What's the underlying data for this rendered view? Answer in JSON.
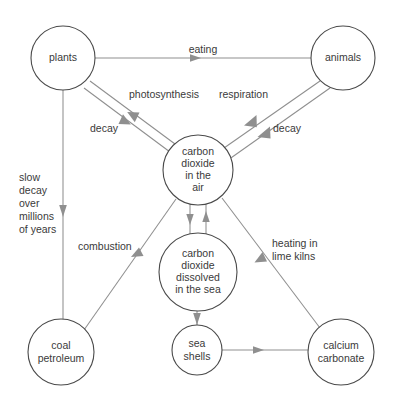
{
  "diagram": {
    "type": "cycle-diagram",
    "colors": {
      "background": "#ffffff",
      "node_stroke": "#4a4a4a",
      "edge_stroke": "#8f8f8f",
      "text": "#3a3a3a"
    },
    "nodes": [
      {
        "id": "plants",
        "label_lines": [
          "plants"
        ],
        "cx": 63,
        "cy": 58,
        "r": 32
      },
      {
        "id": "animals",
        "label_lines": [
          "animals"
        ],
        "cx": 343,
        "cy": 58,
        "r": 32
      },
      {
        "id": "co2_air",
        "label_lines": [
          "carbon",
          "dioxide",
          "in the",
          "air"
        ],
        "cx": 198,
        "cy": 170,
        "r": 35
      },
      {
        "id": "co2_sea",
        "label_lines": [
          "carbon",
          "dioxide",
          "dissolved",
          "in the sea"
        ],
        "cx": 198,
        "cy": 272,
        "r": 39
      },
      {
        "id": "coal_petroleum",
        "label_lines": [
          "coal",
          "petroleum"
        ],
        "cx": 61,
        "cy": 352,
        "r": 33
      },
      {
        "id": "sea_shells",
        "label_lines": [
          "sea",
          "shells"
        ],
        "cx": 197,
        "cy": 350,
        "r": 25
      },
      {
        "id": "calcium_carbonate",
        "label_lines": [
          "calcium",
          "carbonate"
        ],
        "cx": 341,
        "cy": 352,
        "r": 33
      }
    ],
    "edges": [
      {
        "id": "eating",
        "from": "plants",
        "to": "animals",
        "label_lines": [
          "eating"
        ]
      },
      {
        "id": "photosynthesis",
        "from": "co2_air",
        "to": "plants",
        "label_lines": [
          "photosynthesis"
        ]
      },
      {
        "id": "decay_plants",
        "from": "plants",
        "to": "co2_air",
        "label_lines": [
          "decay"
        ]
      },
      {
        "id": "respiration",
        "from": "animals",
        "to": "co2_air",
        "label_lines": [
          "respiration"
        ]
      },
      {
        "id": "decay_animals",
        "from": "animals",
        "to": "co2_air",
        "label_lines": [
          "decay"
        ]
      },
      {
        "id": "slow_decay",
        "from": "plants",
        "to": "coal_petroleum",
        "label_lines": [
          "slow",
          "decay",
          "over",
          "millions",
          "of years"
        ]
      },
      {
        "id": "combustion",
        "from": "coal_petroleum",
        "to": "co2_air",
        "label_lines": [
          "combustion"
        ]
      },
      {
        "id": "dissolving",
        "from": "co2_air",
        "to": "co2_sea",
        "label_lines": []
      },
      {
        "id": "releasing",
        "from": "co2_sea",
        "to": "co2_air",
        "label_lines": []
      },
      {
        "id": "shell_forming",
        "from": "co2_sea",
        "to": "sea_shells",
        "label_lines": []
      },
      {
        "id": "shells_to_cc",
        "from": "sea_shells",
        "to": "calcium_carbonate",
        "label_lines": []
      },
      {
        "id": "lime_kilns",
        "from": "calcium_carbonate",
        "to": "co2_air",
        "label_lines": [
          "heating in",
          "lime kilns"
        ]
      }
    ],
    "edge_labels": {
      "eating": "eating",
      "photosynthesis": "photosynthesis",
      "respiration": "respiration",
      "decay_left": "decay",
      "decay_right": "decay",
      "slow_decay_l1": "slow",
      "slow_decay_l2": "decay",
      "slow_decay_l3": "over",
      "slow_decay_l4": "millions",
      "slow_decay_l5": "of years",
      "combustion": "combustion",
      "lime_kilns_l1": "heating in",
      "lime_kilns_l2": "lime kilns"
    },
    "node_labels": {
      "plants": "plants",
      "animals": "animals",
      "co2_air_l1": "carbon",
      "co2_air_l2": "dioxide",
      "co2_air_l3": "in the",
      "co2_air_l4": "air",
      "co2_sea_l1": "carbon",
      "co2_sea_l2": "dioxide",
      "co2_sea_l3": "dissolved",
      "co2_sea_l4": "in the sea",
      "coal_l1": "coal",
      "coal_l2": "petroleum",
      "shells_l1": "sea",
      "shells_l2": "shells",
      "cc_l1": "calcium",
      "cc_l2": "carbonate"
    }
  }
}
